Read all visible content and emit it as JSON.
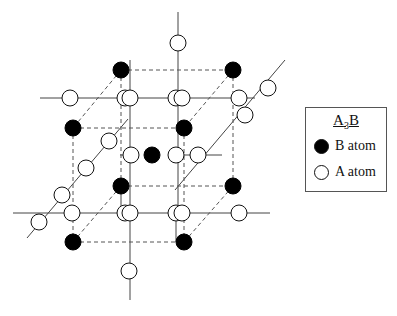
{
  "legend": {
    "title_main_a": "A",
    "title_sub": "3",
    "title_main_b": "B",
    "items": [
      {
        "symbol": "filled-circle",
        "label": "B atom"
      },
      {
        "symbol": "open-circle",
        "label": "A atom"
      }
    ]
  },
  "colors": {
    "b_atom": "#000000",
    "a_atom_fill": "#ffffff",
    "stroke": "#111111",
    "axis_line": "#444444",
    "dashed_line": "#555555"
  },
  "atoms": {
    "b": [
      [
        121,
        70
      ],
      [
        233,
        70
      ],
      [
        73,
        128
      ],
      [
        184,
        128
      ],
      [
        152,
        155
      ],
      [
        121,
        186
      ],
      [
        233,
        186
      ],
      [
        73,
        242
      ],
      [
        184,
        242
      ]
    ],
    "a": [
      [
        178,
        43
      ],
      [
        70,
        98
      ],
      [
        125,
        98
      ],
      [
        130,
        98
      ],
      [
        176,
        98
      ],
      [
        182,
        98
      ],
      [
        239,
        98
      ],
      [
        268,
        88
      ],
      [
        245,
        115
      ],
      [
        109,
        141
      ],
      [
        131,
        155
      ],
      [
        176,
        155
      ],
      [
        198,
        155
      ],
      [
        86,
        168
      ],
      [
        62,
        195
      ],
      [
        39,
        222
      ],
      [
        72,
        213
      ],
      [
        125,
        213
      ],
      [
        130,
        213
      ],
      [
        176,
        213
      ],
      [
        182,
        213
      ],
      [
        239,
        213
      ],
      [
        129,
        271
      ]
    ]
  }
}
